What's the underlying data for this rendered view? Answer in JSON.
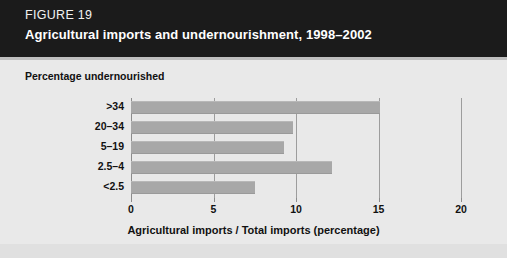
{
  "header": {
    "figure_number": "FIGURE 19",
    "title": "Agricultural imports and undernourishment, 1998–2002",
    "band_color": "#1b1b1b",
    "text_color": "#ffffff"
  },
  "panel": {
    "background_color": "#e9e9e9",
    "group_title": "Percentage undernourished"
  },
  "chart_data": {
    "type": "bar",
    "orientation": "horizontal",
    "title": "Agricultural imports and undernourishment, 1998–2002",
    "subtitle": "",
    "categories": [
      ">34",
      "20–34",
      "5–19",
      "2.5–4",
      "<2.5"
    ],
    "values": [
      15.1,
      9.8,
      9.3,
      12.2,
      7.5
    ],
    "series": [
      {
        "name": "Agricultural imports / Total imports (percentage)",
        "values": [
          15.1,
          9.8,
          9.3,
          12.2,
          7.5
        ]
      }
    ],
    "xlabel": "Agricultural imports / Total imports (percentage)",
    "ylabel": "Percentage undernourished",
    "xlim": [
      0,
      20
    ],
    "xticks": [
      0,
      5,
      10,
      15,
      20
    ],
    "xtick_labels": [
      "0",
      "5",
      "10",
      "15",
      "20"
    ],
    "grid": "vertical",
    "legend": "none",
    "bar_color": "#a8a8a8",
    "gridline_color": "#9d9d9d"
  }
}
